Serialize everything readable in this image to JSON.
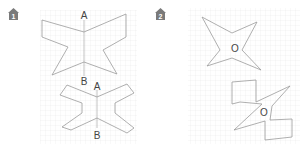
{
  "panels": [
    {
      "number": "1",
      "icon": "numbered-house-badge-icon",
      "shapes": [
        {
          "name": "top-figure",
          "labels": {
            "top": "A",
            "bottom": "B"
          }
        },
        {
          "name": "bottom-figure",
          "labels": {
            "top_left": "B",
            "top": "A",
            "bottom": "B"
          }
        }
      ]
    },
    {
      "number": "2",
      "icon": "numbered-house-badge-icon",
      "shapes": [
        {
          "name": "star-figure",
          "labels": {
            "center": "O"
          }
        },
        {
          "name": "pinwheel-figure",
          "labels": {
            "center": "O"
          }
        }
      ]
    }
  ],
  "colors": {
    "grid": "#e6e6e6",
    "outline": "#9a9a9a",
    "badge": "#7a7a7a",
    "text": "#444444"
  }
}
